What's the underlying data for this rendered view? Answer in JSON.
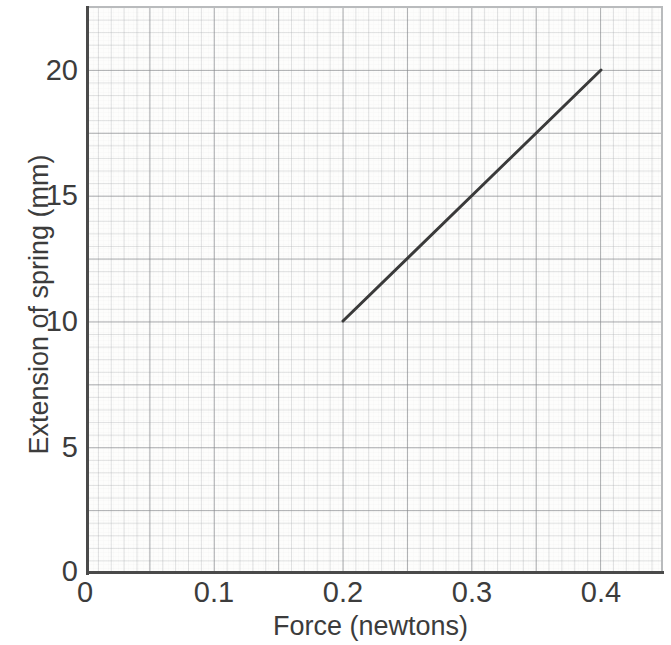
{
  "chart_data": {
    "type": "line",
    "title": "",
    "xlabel": "Force (newtons)",
    "ylabel": "Extension of spring (mm)",
    "xlim": [
      0,
      0.445
    ],
    "ylim": [
      0,
      22.5
    ],
    "xticks": [
      "0",
      "0.1",
      "0.2",
      "0.3",
      "0.4"
    ],
    "xtick_values": [
      0,
      0.1,
      0.2,
      0.3,
      0.4
    ],
    "yticks": [
      "0",
      "5",
      "10",
      "15",
      "20"
    ],
    "ytick_values": [
      0,
      5,
      10,
      15,
      20
    ],
    "grid": "graph-paper: minor 0.01 N x 0.5 mm, major 0.05 N x 2.5 mm",
    "legend": "none",
    "series": [
      {
        "name": "Extension of spring vs force",
        "x": [
          0.2,
          0.4
        ],
        "y": [
          10,
          20
        ],
        "color": "#3a3a3a",
        "line_width_px": 3,
        "slope_mm_per_newton": 50,
        "markers": "none"
      }
    ],
    "annotations": []
  },
  "axes": {
    "x": {
      "label": "Force (newtons)",
      "ticks": [
        {
          "label": "0",
          "value": 0
        },
        {
          "label": "0.1",
          "value": 0.1
        },
        {
          "label": "0.2",
          "value": 0.2
        },
        {
          "label": "0.3",
          "value": 0.3
        },
        {
          "label": "0.4",
          "value": 0.4
        }
      ]
    },
    "y": {
      "label": "Extension of spring (mm)",
      "ticks": [
        {
          "label": "0",
          "value": 0
        },
        {
          "label": "5",
          "value": 5
        },
        {
          "label": "10",
          "value": 10
        },
        {
          "label": "15",
          "value": 15
        },
        {
          "label": "20",
          "value": 20
        }
      ]
    }
  },
  "colors": {
    "line": "#3a3a3a",
    "axis": "#4a4a4a",
    "grid_major": "#828488",
    "grid_minor": "#a5a8ac",
    "text": "#3c3c3c",
    "paper": "#fdfdfc"
  }
}
